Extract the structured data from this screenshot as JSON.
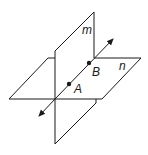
{
  "diagram": {
    "type": "intersecting-planes",
    "planes": [
      {
        "id": "m",
        "label": "m",
        "orientation": "vertical"
      },
      {
        "id": "n",
        "label": "n",
        "orientation": "horizontal"
      }
    ],
    "points": [
      {
        "id": "A",
        "label": "A"
      },
      {
        "id": "B",
        "label": "B"
      }
    ],
    "line": {
      "through": [
        "A",
        "B"
      ],
      "description": "line of intersection with arrows at both ends"
    },
    "colors": {
      "stroke": "#1a1a1a",
      "background": "#ffffff"
    }
  }
}
